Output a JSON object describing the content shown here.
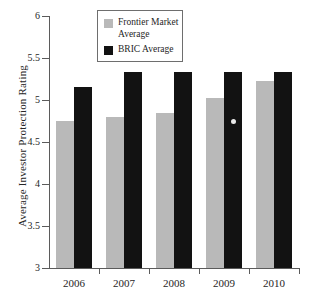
{
  "chart_data": {
    "type": "bar",
    "title": "",
    "subtitle": "",
    "xlabel": "",
    "ylabel": "Average Investor Protection Rating",
    "categories": [
      "2006",
      "2007",
      "2008",
      "2009",
      "2010"
    ],
    "series": [
      {
        "name": "Frontier Market Average",
        "color": "#b9b9b9",
        "values": [
          4.75,
          4.8,
          4.84,
          5.02,
          5.23
        ]
      },
      {
        "name": "BRIC Average",
        "color": "#121212",
        "values": [
          5.15,
          5.33,
          5.33,
          5.33,
          5.33
        ]
      }
    ],
    "ylim": [
      3,
      6
    ],
    "yticks": [
      3,
      3.5,
      4,
      4.5,
      5,
      5.5,
      6
    ],
    "ytick_labels": [
      "3",
      "3.5",
      "4",
      "4.5",
      "5",
      "5.5",
      "6"
    ],
    "grid": false,
    "legend_position": "top-center",
    "annotations": [
      {
        "name": "bar-marker",
        "series": "BRIC Average",
        "category": "2009",
        "value": 4.74
      }
    ]
  },
  "legend": {
    "entries": [
      {
        "label": "Frontier Market\nAverage",
        "color": "#b9b9b9"
      },
      {
        "label": "BRIC Average",
        "color": "#121212"
      }
    ]
  },
  "axes": {
    "y_title": "Average Investor Protection Rating"
  }
}
